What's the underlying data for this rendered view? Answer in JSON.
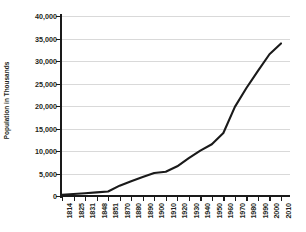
{
  "chart_data": {
    "type": "line",
    "title": "",
    "xlabel": "",
    "ylabel": "Population in Thousands",
    "categories": [
      "1814",
      "1825",
      "1831",
      "1848",
      "1851",
      "1870",
      "1880",
      "1890",
      "1900",
      "1910",
      "1920",
      "1930",
      "1940",
      "1950",
      "1960",
      "1970",
      "1980",
      "1990",
      "2000",
      "2010"
    ],
    "values": [
      250,
      450,
      600,
      800,
      1000,
      2300,
      3300,
      4200,
      5100,
      5400,
      6600,
      8400,
      10100,
      11500,
      14000,
      19800,
      24000,
      27800,
      31500,
      33900
    ],
    "ylim": [
      0,
      40000
    ],
    "y_ticks": [
      0,
      5000,
      10000,
      15000,
      20000,
      25000,
      30000,
      35000,
      40000
    ],
    "y_tick_labels": [
      "0",
      "5,000",
      "10,000",
      "15,000",
      "20,000",
      "25,000",
      "30,000",
      "35,000",
      "40,000"
    ],
    "grid": true,
    "grid_color": "#d9d9d9",
    "legend": false,
    "series_color": "#1a1a1a",
    "axis_color": "#1a1a1a",
    "text_color": "#231f20",
    "background": "#ffffff"
  }
}
